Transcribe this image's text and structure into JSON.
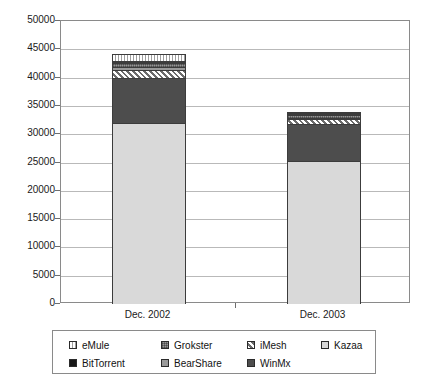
{
  "chart_data": {
    "type": "bar",
    "subtype": "stacked-bar",
    "title": "",
    "xlabel": "",
    "ylabel": "",
    "ylim": [
      0,
      50000
    ],
    "ytick_step": 5000,
    "yticks": [
      "50000",
      "45000",
      "40000",
      "35000",
      "30000",
      "25000",
      "20000",
      "15000",
      "10000",
      "5000",
      "0"
    ],
    "grid": true,
    "legend_position": "bottom",
    "categories": [
      "Dec. 2002",
      "Dec. 2003"
    ],
    "series": [
      {
        "name": "Kazaa",
        "values": [
          32000,
          25200
        ],
        "color": "#d9d9d9",
        "pattern": "solid-light-gray"
      },
      {
        "name": "WinMx",
        "values": [
          7900,
          6600
        ],
        "color": "#4d4d4d",
        "pattern": "solid-dark-gray"
      },
      {
        "name": "iMesh",
        "values": [
          1400,
          800
        ],
        "color": "#6b6b6b",
        "pattern": "diagonal-hatch"
      },
      {
        "name": "BearShare",
        "values": [
          500,
          350
        ],
        "color": "#9a9a9a",
        "pattern": "solid-mid-gray"
      },
      {
        "name": "Grokster",
        "values": [
          700,
          450
        ],
        "color": "#8c8c8c",
        "pattern": "checkered"
      },
      {
        "name": "BitTorrent",
        "values": [
          250,
          150
        ],
        "color": "#171717",
        "pattern": "solid-black"
      },
      {
        "name": "eMule",
        "values": [
          1350,
          400
        ],
        "color": "#ffffff",
        "pattern": "vertical-hatch"
      }
    ],
    "totals": [
      44100,
      33950
    ]
  },
  "legend": {
    "rows": [
      [
        {
          "label": "eMule",
          "swatch": "vertical-hatch"
        },
        {
          "label": "Grokster",
          "swatch": "checkered"
        },
        {
          "label": "iMesh",
          "swatch": "diagonal-hatch"
        },
        {
          "label": "Kazaa",
          "swatch": "solid-light-gray"
        }
      ],
      [
        {
          "label": "BitTorrent",
          "swatch": "solid-black"
        },
        {
          "label": "BearShare",
          "swatch": "solid-mid-gray"
        },
        {
          "label": "WinMx",
          "swatch": "solid-dark-gray"
        }
      ]
    ]
  }
}
